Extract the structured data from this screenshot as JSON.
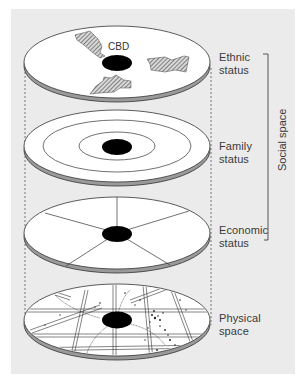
{
  "figure": {
    "layers": [
      {
        "id": "ethnic",
        "label_line1": "Ethnic",
        "label_line2": "status",
        "pattern": "hatched-clusters"
      },
      {
        "id": "family",
        "label_line1": "Family",
        "label_line2": "status",
        "pattern": "concentric-zones"
      },
      {
        "id": "economic",
        "label_line1": "Economic",
        "label_line2": "status",
        "pattern": "sectors"
      },
      {
        "id": "physical",
        "label_line1": "Physical",
        "label_line2": "space",
        "pattern": "street-grid"
      }
    ],
    "center_label": "CBD",
    "bracket_label": "Social space",
    "colors": {
      "panel_bg": "#ebebeb",
      "disc_fill": "#ffffff",
      "disc_edge": "#9a9a9a",
      "outline": "#333333",
      "cbd_fill": "#000000"
    }
  }
}
